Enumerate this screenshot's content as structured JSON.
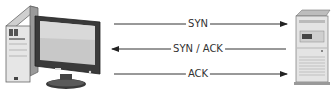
{
  "diagram": {
    "client": {
      "label": "client-computer"
    },
    "server": {
      "label": "server"
    },
    "messages": [
      {
        "label": "SYN",
        "direction": "right"
      },
      {
        "label": "SYN / ACK",
        "direction": "left"
      },
      {
        "label": "ACK",
        "direction": "right"
      }
    ]
  }
}
